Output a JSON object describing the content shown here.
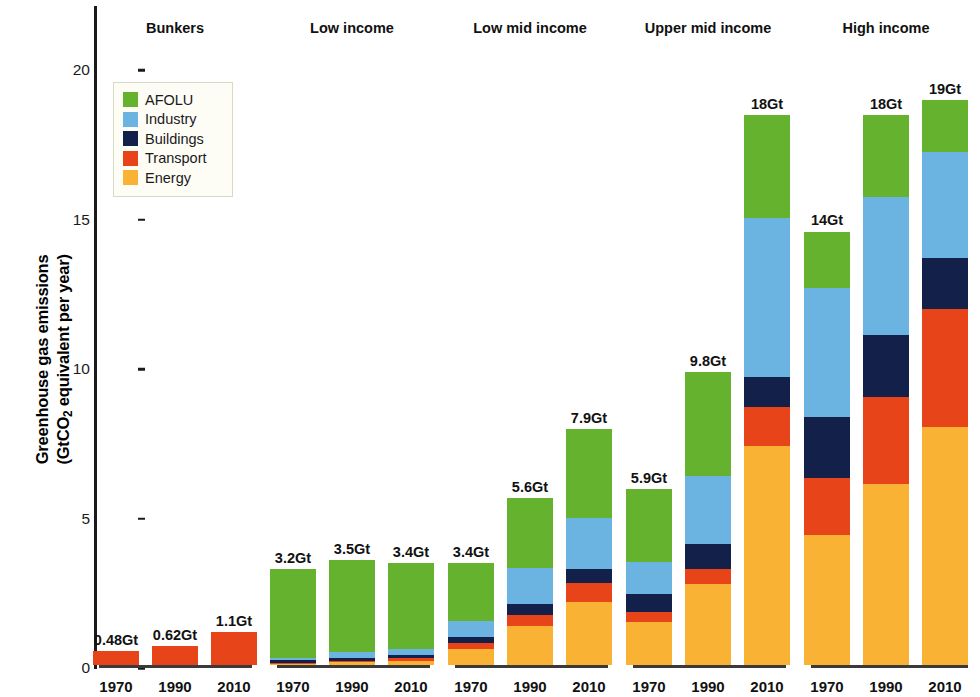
{
  "chart_data": {
    "type": "bar",
    "stacked": true,
    "title": "",
    "xlabel": "",
    "ylabel": "Greenhouse gas emissions (GtCO2 equivalent per year)",
    "ylabel_line1": "Greenhouse gas emissions",
    "ylabel_line2_pre": "(GtCO",
    "ylabel_line2_sub": "2",
    "ylabel_line2_post": " equivalent per year)",
    "ylim": [
      0,
      21.5
    ],
    "yticks": [
      0,
      5,
      10,
      15,
      20
    ],
    "ytick_labels": [
      "0",
      "5",
      "10",
      "15",
      "20"
    ],
    "grid": false,
    "legend_position": "inside-upper-left",
    "series_order_bottom_to_top": [
      "Energy",
      "Transport",
      "Buildings",
      "Industry",
      "AFOLU"
    ],
    "legend": [
      {
        "name": "AFOLU",
        "color": "#65b22e"
      },
      {
        "name": "Industry",
        "color": "#6bb3e0"
      },
      {
        "name": "Buildings",
        "color": "#13204a"
      },
      {
        "name": "Transport",
        "color": "#e8441a"
      },
      {
        "name": "Energy",
        "color": "#f9b233"
      }
    ],
    "categories": [
      "1970",
      "1990",
      "2010"
    ],
    "groups": [
      {
        "name": "Bunkers",
        "bars": [
          {
            "year": "1970",
            "total_label": "0.48Gt",
            "total": 0.48,
            "segments": {
              "Energy": 0.0,
              "Transport": 0.48,
              "Buildings": 0.0,
              "Industry": 0.0,
              "AFOLU": 0.0
            }
          },
          {
            "year": "1990",
            "total_label": "0.62Gt",
            "total": 0.62,
            "segments": {
              "Energy": 0.0,
              "Transport": 0.62,
              "Buildings": 0.0,
              "Industry": 0.0,
              "AFOLU": 0.0
            }
          },
          {
            "year": "2010",
            "total_label": "1.1Gt",
            "total": 1.1,
            "segments": {
              "Energy": 0.0,
              "Transport": 1.1,
              "Buildings": 0.0,
              "Industry": 0.0,
              "AFOLU": 0.0
            }
          }
        ]
      },
      {
        "name": "Low income",
        "bars": [
          {
            "year": "1970",
            "total_label": "3.2Gt",
            "total": 3.2,
            "segments": {
              "Energy": 0.04,
              "Transport": 0.03,
              "Buildings": 0.09,
              "Industry": 0.09,
              "AFOLU": 2.95
            }
          },
          {
            "year": "1990",
            "total_label": "3.5Gt",
            "total": 3.5,
            "segments": {
              "Energy": 0.09,
              "Transport": 0.05,
              "Buildings": 0.1,
              "Industry": 0.21,
              "AFOLU": 3.05
            }
          },
          {
            "year": "2010",
            "total_label": "3.4Gt",
            "total": 3.4,
            "segments": {
              "Energy": 0.15,
              "Transport": 0.07,
              "Buildings": 0.1,
              "Industry": 0.21,
              "AFOLU": 2.87
            }
          }
        ]
      },
      {
        "name": "Low mid income",
        "bars": [
          {
            "year": "1970",
            "total_label": "3.4Gt",
            "total": 3.4,
            "segments": {
              "Energy": 0.55,
              "Transport": 0.18,
              "Buildings": 0.2,
              "Industry": 0.55,
              "AFOLU": 1.92
            }
          },
          {
            "year": "1990",
            "total_label": "5.6Gt",
            "total": 5.6,
            "segments": {
              "Energy": 1.3,
              "Transport": 0.36,
              "Buildings": 0.38,
              "Industry": 1.21,
              "AFOLU": 2.35
            }
          },
          {
            "year": "2010",
            "total_label": "7.9Gt",
            "total": 7.9,
            "segments": {
              "Energy": 2.12,
              "Transport": 0.63,
              "Buildings": 0.45,
              "Industry": 1.72,
              "AFOLU": 2.98
            }
          }
        ]
      },
      {
        "name": "Upper mid income",
        "bars": [
          {
            "year": "1970",
            "total_label": "5.9Gt",
            "total": 5.9,
            "segments": {
              "Energy": 1.45,
              "Transport": 0.34,
              "Buildings": 0.57,
              "Industry": 1.09,
              "AFOLU": 2.45
            }
          },
          {
            "year": "1990",
            "total_label": "9.8Gt",
            "total": 9.8,
            "segments": {
              "Energy": 2.7,
              "Transport": 0.52,
              "Buildings": 0.84,
              "Industry": 2.25,
              "AFOLU": 3.49
            }
          },
          {
            "year": "2010",
            "total_label": "18Gt",
            "total": 18.4,
            "segments": {
              "Energy": 7.32,
              "Transport": 1.3,
              "Buildings": 1.02,
              "Industry": 5.3,
              "AFOLU": 3.46
            }
          }
        ]
      },
      {
        "name": "High income",
        "bars": [
          {
            "year": "1970",
            "total_label": "14Gt",
            "total": 14.5,
            "segments": {
              "Energy": 4.35,
              "Transport": 1.9,
              "Buildings": 2.05,
              "Industry": 4.3,
              "AFOLU": 1.9
            }
          },
          {
            "year": "1990",
            "total_label": "18Gt",
            "total": 18.4,
            "segments": {
              "Energy": 6.05,
              "Transport": 2.9,
              "Buildings": 2.1,
              "Industry": 4.6,
              "AFOLU": 2.75
            }
          },
          {
            "year": "2010",
            "total_label": "19Gt",
            "total": 18.9,
            "segments": {
              "Energy": 7.95,
              "Transport": 3.95,
              "Buildings": 1.7,
              "Industry": 3.55,
              "AFOLU": 1.75
            }
          }
        ]
      }
    ]
  }
}
